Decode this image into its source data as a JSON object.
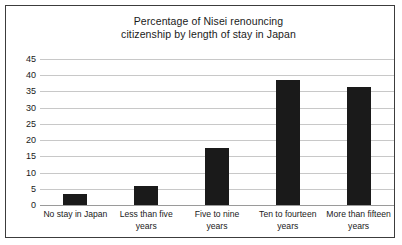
{
  "chart_data": {
    "type": "bar",
    "title": "Percentage of Nisei renouncing citizenship by length of stay in Japan",
    "title_lines": [
      "Percentage of Nisei renouncing",
      "citizenship by length of stay in Japan"
    ],
    "categories": [
      "No stay in Japan",
      "Less than five years",
      "Five to nine years",
      "Ten to fourteen years",
      "More than fifteen years"
    ],
    "category_lines": [
      [
        "No stay in Japan"
      ],
      [
        "Less than five",
        "years"
      ],
      [
        "Five to nine",
        "years"
      ],
      [
        "Ten to fourteen",
        "years"
      ],
      [
        "More than fifteen",
        "years"
      ]
    ],
    "values": [
      3.5,
      6,
      17.5,
      38.5,
      36.5
    ],
    "xlabel": "",
    "ylabel": "",
    "ylim": [
      0,
      45
    ],
    "yticks": [
      0,
      5,
      10,
      15,
      20,
      25,
      30,
      35,
      40,
      45
    ],
    "grid": true,
    "legend": false,
    "bar_color": "#1a1a1a",
    "grid_color": "#c8c8c8",
    "frame_color": "#3c3c3c",
    "background_color": "#ffffff"
  }
}
